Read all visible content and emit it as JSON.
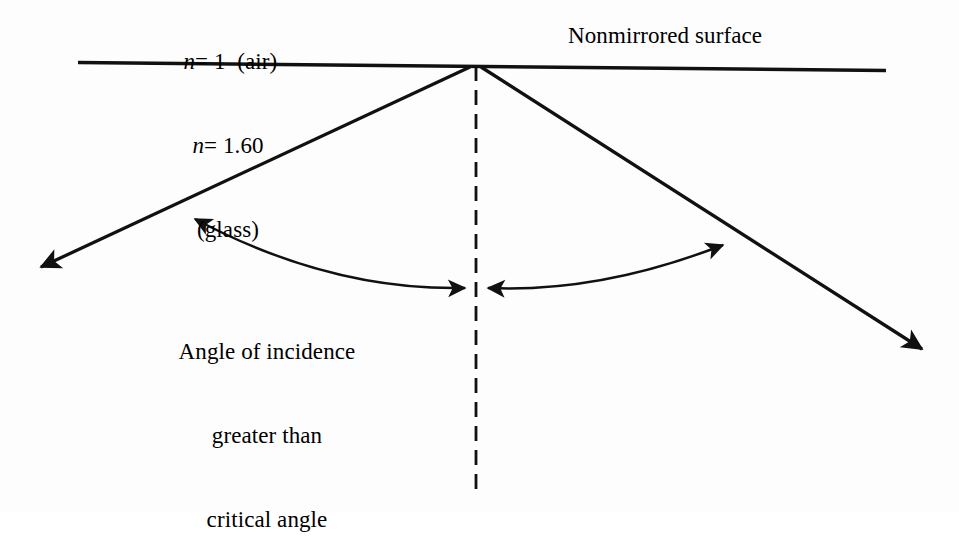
{
  "figure": {
    "background_color": "#fdfdfd",
    "ink_color": "#000000"
  },
  "labels": {
    "air_medium": {
      "symbol": "n",
      "relation": "= 1",
      "material": "(air)",
      "full_text": "n = 1  (air)"
    },
    "glass_medium": {
      "symbol": "n",
      "relation": "= 1.60",
      "material": "(glass)",
      "line1": "= 1.60",
      "line2": "(glass)",
      "full_text": "n = 1.60 (glass)"
    },
    "surface": {
      "text": "Nonmirrored surface"
    },
    "angle_note": {
      "line1": "Angle of incidence",
      "line2": "greater than",
      "line3": "critical angle",
      "full_text": "Angle of incidence greater than critical angle"
    }
  },
  "geometry": {
    "interface_line": {
      "name": "nonmirrored-surface-line",
      "x1": 78,
      "y1": 62,
      "x2": 886,
      "y2": 70,
      "stroke_width": 3.2
    },
    "vertex": {
      "x": 476,
      "y": 65
    },
    "normal_dashed_line": {
      "x1": 476,
      "y1": 65,
      "x2": 476,
      "y2": 492,
      "dash": "14 9",
      "stroke_width": 2.6
    },
    "incident_ray": {
      "from_x": 32,
      "from_y": 272,
      "to_x": 476,
      "to_y": 65,
      "arrow_at": "from",
      "stroke_width": 3.2
    },
    "reflected_ray": {
      "from_x": 476,
      "from_y": 65,
      "to_x": 931,
      "to_y": 356,
      "arrow_at": "to",
      "stroke_width": 3.2
    },
    "left_angle_arc": {
      "start_x": 186,
      "start_y": 213,
      "end_x": 472,
      "end_y": 288,
      "control_x": 320,
      "control_y": 290,
      "arrow_at": "both",
      "stroke_width": 2.4
    },
    "right_angle_arc": {
      "start_x": 732,
      "start_y": 239,
      "end_x": 481,
      "end_y": 288,
      "control_x": 604,
      "control_y": 292,
      "arrow_at": "both",
      "stroke_width": 2.4
    }
  },
  "annotations": {
    "arrowheads": [
      {
        "name": "incident-ray-arrowhead",
        "x": 32,
        "y": 272,
        "points_toward": "lower-left"
      },
      {
        "name": "reflected-ray-arrowhead",
        "x": 931,
        "y": 356,
        "points_toward": "lower-right"
      },
      {
        "name": "left-arc-outer-arrowhead",
        "x": 186,
        "y": 213,
        "points_toward": "upper-left"
      },
      {
        "name": "left-arc-inner-arrowhead",
        "x": 472,
        "y": 288,
        "points_toward": "right"
      },
      {
        "name": "right-arc-outer-arrowhead",
        "x": 732,
        "y": 239,
        "points_toward": "upper-right"
      },
      {
        "name": "right-arc-inner-arrowhead",
        "x": 481,
        "y": 288,
        "points_toward": "left"
      }
    ]
  }
}
